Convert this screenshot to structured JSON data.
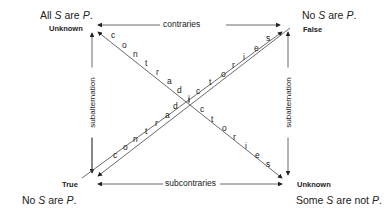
{
  "corners": {
    "A": {
      "proposition_parts": [
        "All ",
        "S",
        " are ",
        "P",
        "."
      ],
      "value": "Unknown"
    },
    "E": {
      "proposition_parts": [
        "No ",
        "S",
        " are ",
        "P",
        "."
      ],
      "value": "False"
    },
    "I": {
      "proposition_parts": [
        "No ",
        "S",
        " are ",
        "P",
        "."
      ],
      "value": "True"
    },
    "O": {
      "proposition_parts": [
        "Some ",
        "S",
        " are not ",
        "P",
        "."
      ],
      "value": "Unknown"
    }
  },
  "relations": {
    "top": "contraries",
    "bottom": "subcontraries",
    "left": "subalternation",
    "right": "subalternation",
    "diag_a": [
      "c",
      "o",
      "n",
      "t",
      "r",
      "a",
      "d",
      "i",
      "c",
      "t",
      "o",
      "r",
      "i",
      "e",
      "s"
    ],
    "diag_b": [
      "c",
      "o",
      "n",
      "t",
      "r",
      "a",
      "d",
      "i",
      "c",
      "t",
      "o",
      "r",
      "i",
      "e",
      "s"
    ]
  }
}
